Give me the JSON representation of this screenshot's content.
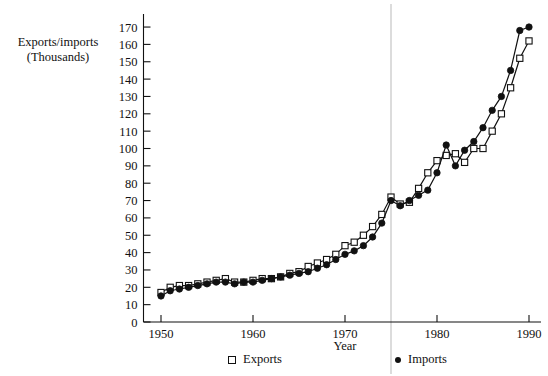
{
  "chart_data": {
    "type": "line",
    "title": "",
    "xlabel": "Year",
    "ylabel": "Exports/imports\n(Thousands)",
    "xlim": [
      1949,
      1991
    ],
    "ylim": [
      0,
      175
    ],
    "xticks": [
      1950,
      1960,
      1970,
      1980,
      1990
    ],
    "yticks": [
      0,
      10,
      20,
      30,
      40,
      50,
      60,
      70,
      80,
      90,
      100,
      110,
      120,
      130,
      140,
      150,
      160,
      170
    ],
    "grid": false,
    "vertical_reference_line": 1975,
    "legend_position": "bottom",
    "x": [
      1950,
      1951,
      1952,
      1953,
      1954,
      1955,
      1956,
      1957,
      1958,
      1959,
      1960,
      1961,
      1962,
      1963,
      1964,
      1965,
      1966,
      1967,
      1968,
      1969,
      1970,
      1971,
      1972,
      1973,
      1974,
      1975,
      1976,
      1977,
      1978,
      1979,
      1980,
      1981,
      1982,
      1983,
      1984,
      1985,
      1986,
      1987,
      1988,
      1989,
      1990
    ],
    "series": [
      {
        "name": "Exports",
        "marker": "open-square",
        "values": [
          17,
          20,
          21,
          21,
          22,
          23,
          24,
          25,
          23,
          23,
          24,
          25,
          25,
          26,
          28,
          29,
          32,
          34,
          36,
          39,
          44,
          46,
          50,
          55,
          62,
          72,
          68,
          69,
          77,
          86,
          93,
          96,
          97,
          92,
          100,
          100,
          110,
          120,
          135,
          152,
          162
        ]
      },
      {
        "name": "Imports",
        "marker": "filled-circle",
        "values": [
          15,
          18,
          19,
          20,
          21,
          22,
          23,
          23,
          22,
          23,
          23,
          24,
          25,
          26,
          27,
          28,
          29,
          31,
          33,
          36,
          39,
          41,
          44,
          49,
          57,
          70,
          67,
          70,
          73,
          76,
          86,
          102,
          90,
          99,
          104,
          112,
          122,
          130,
          145,
          168,
          170
        ]
      }
    ]
  },
  "legend": {
    "exports_label": "Exports",
    "imports_label": "Imports",
    "exports_marker": "open-square-icon",
    "imports_marker": "filled-circle-icon"
  },
  "axes": {
    "y_tick_labels": [
      "170",
      "160",
      "150",
      "140",
      "130",
      "120",
      "110",
      "100",
      "90",
      "80",
      "70",
      "60",
      "50",
      "40",
      "30",
      "20",
      "10",
      "0"
    ],
    "x_tick_labels": [
      "1950",
      "1960",
      "1970",
      "1980",
      "1990"
    ],
    "y_axis_title": "Exports/imports\n(Thousands)",
    "x_axis_title": "Year"
  },
  "colors": {
    "ink": "#111111",
    "background": "#ffffff",
    "reference_line": "#b9b9b9"
  }
}
